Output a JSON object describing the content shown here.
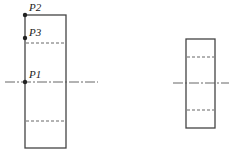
{
  "diagram": {
    "left_view": {
      "points": [
        {
          "label": "P2",
          "x": 25,
          "y": 15
        },
        {
          "label": "P3",
          "x": 25,
          "y": 38
        },
        {
          "label": "P1",
          "x": 25,
          "y": 82
        }
      ]
    },
    "right_view": {},
    "colors": {
      "stroke": "#444444",
      "dash": "#555555",
      "point": "#222222"
    }
  }
}
